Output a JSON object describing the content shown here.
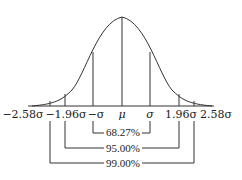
{
  "diagram": {
    "axis_labels": [
      {
        "id": "neg258",
        "text": "−2.58σ",
        "x": 23
      },
      {
        "id": "neg196",
        "text": "−1.96σ",
        "x": 65
      },
      {
        "id": "negsigma",
        "text": "−σ",
        "x": 95
      },
      {
        "id": "mu",
        "text": "μ",
        "x": 122
      },
      {
        "id": "sigma",
        "text": "σ",
        "x": 150
      },
      {
        "id": "pos196",
        "text": "1.96σ",
        "x": 180
      },
      {
        "id": "pos258",
        "text": "2.58σ",
        "x": 212
      }
    ],
    "brackets": [
      {
        "id": "b6827",
        "label": "68.27%",
        "from": "−σ",
        "to": "σ"
      },
      {
        "id": "b9500",
        "label": "95.00%",
        "from": "−1.96σ",
        "to": "1.96σ"
      },
      {
        "id": "b9900",
        "label": "99.00%",
        "from": "−2.58σ",
        "to": "2.58σ"
      }
    ],
    "colors": {
      "line": "#333333",
      "text": "#222222",
      "background": "#ffffff"
    }
  }
}
